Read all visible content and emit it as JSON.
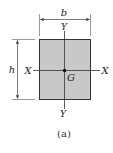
{
  "figure": {
    "caption": "(a)",
    "shape": "rectangle",
    "colors": {
      "fill": "#c8c8c8",
      "stroke": "#333333",
      "axis": "#333333",
      "dimension": "#444444"
    },
    "labels": {
      "width": "b",
      "height": "h",
      "y_axis_top": "Y",
      "y_axis_bottom": "Y",
      "x_axis_left": "X",
      "x_axis_right": "X",
      "centroid": "G"
    }
  }
}
